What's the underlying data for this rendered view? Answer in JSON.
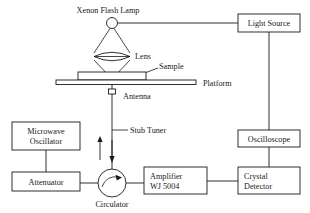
{
  "diagram": {
    "background_color": "#ffffff",
    "line_color": "#1a1a1a",
    "boxes": [
      {
        "id": "light_source",
        "label": "Light Source"
      },
      {
        "id": "oscilloscope",
        "label": "Oscilloscope"
      },
      {
        "id": "crystal_detector",
        "label_line1": "Crystal",
        "label_line2": "Detector"
      },
      {
        "id": "amplifier",
        "label_line1": "Amplifier",
        "label_line2": "WJ 5004"
      },
      {
        "id": "microwave_oscillator",
        "label_line1": "Microwave",
        "label_line2": "Oscillator"
      },
      {
        "id": "attenuator",
        "label": "Attenuator"
      }
    ],
    "labels": {
      "xenon_flash_lamp": "Xenon Flash Lamp",
      "lens": "Lens",
      "sample": "Sample",
      "platform": "Platform",
      "antenna": "Antenna",
      "stub_tuner": "Stub Tuner",
      "circulator": "Circulator"
    },
    "components": {
      "lamp": "xenon-flash-lamp-bulb",
      "lens": "biconvex-lens",
      "sample": "hatched-sample-block",
      "platform": "platform-bar",
      "antenna": "antenna-coupler",
      "circulator": "circulator-circle-with-rotation-arrow",
      "arrow_up": "microwave-incident-arrow",
      "arrow_down": "microwave-reflected-arrow"
    }
  }
}
